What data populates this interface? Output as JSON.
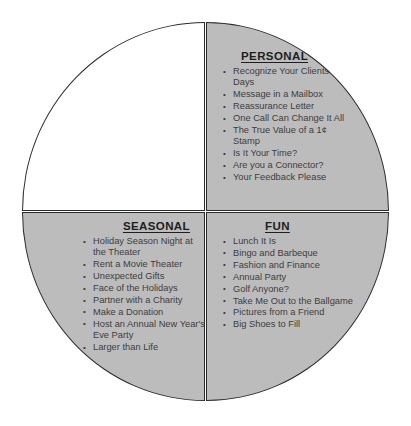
{
  "diagram": {
    "shape": "circle-split-in-four-quadrants",
    "colors": {
      "filled_quadrant": "#bcbcbc",
      "empty_quadrant": "#ffffff",
      "outline": "#2b2b2b",
      "heading_text": "#1e1e1e",
      "body_text": "#3d3d3d"
    },
    "quadrants": [
      {
        "position": "top-left",
        "title": "",
        "filled": false,
        "items": []
      },
      {
        "position": "top-right",
        "title": "PERSONAL",
        "filled": true,
        "items": [
          "Recognize Your Clients' Big Days",
          "Message in a Mailbox",
          "Reassurance Letter",
          "One Call Can Change It All",
          "The True Value of a 1¢ Stamp",
          "Is It Your Time?",
          "Are you a Connector?",
          "Your Feedback Please"
        ]
      },
      {
        "position": "bottom-left",
        "title": "SEASONAL",
        "filled": true,
        "items": [
          "Holiday Season Night at the Theater",
          "Rent a Movie Theater",
          "Unexpected Gifts",
          "Face of the Holidays",
          "Partner with a Charity",
          "Make a Donation",
          "Host an Annual New Year's Eve Party",
          "Larger than Life"
        ]
      },
      {
        "position": "bottom-right",
        "title": "FUN",
        "filled": true,
        "items": [
          "Lunch It Is",
          "Bingo and Barbeque",
          "Fashion and Finance",
          "Annual Party",
          "Golf Anyone?",
          "Take Me Out to the Ballgame",
          "Pictures from a Friend",
          "Big Shoes to Fill"
        ]
      }
    ]
  }
}
